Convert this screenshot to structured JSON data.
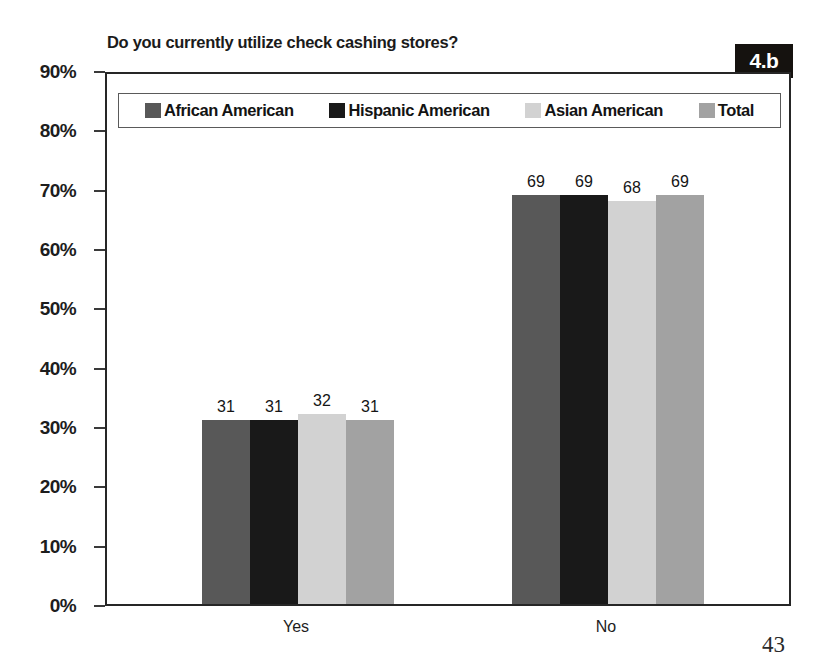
{
  "figure": {
    "badge": "4.b",
    "page_number": "43"
  },
  "chart_data": {
    "type": "bar",
    "title": "Do you currently utilize check cashing stores?",
    "xlabel": "",
    "ylabel": "",
    "categories": [
      "Yes",
      "No"
    ],
    "series": [
      {
        "name": "African American",
        "values": [
          31,
          31
        ],
        "color": "#585858"
      },
      {
        "name": "Hispanic American",
        "values": [
          31,
          31
        ],
        "color": "#191919"
      },
      {
        "name": "Asian American",
        "values": [
          32,
          32
        ],
        "color": "#d2d2d2"
      },
      {
        "name": "Total",
        "values": [
          31,
          31
        ],
        "color": "#a2a2a2"
      }
    ],
    "value_labels": {
      "Yes": [
        "31",
        "31",
        "32",
        "31"
      ],
      "No": [
        "69",
        "69",
        "68",
        "69"
      ]
    },
    "displayed_values": {
      "Yes": [
        31,
        31,
        32,
        31
      ],
      "No": [
        69,
        69,
        68,
        69
      ]
    },
    "ylim": [
      0,
      90
    ],
    "ytick_labels": [
      "90%",
      "80%",
      "70%",
      "60%",
      "50%",
      "40%",
      "30%",
      "20%",
      "10%",
      "0%"
    ],
    "ytick_values": [
      90,
      80,
      70,
      60,
      50,
      40,
      30,
      20,
      10,
      0
    ],
    "grid": false,
    "legend_position": "top-inside"
  }
}
